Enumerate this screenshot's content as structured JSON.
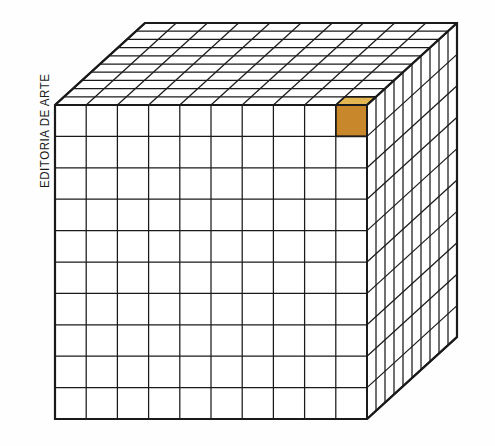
{
  "figure": {
    "credit": "EDITORIA DE ARTE",
    "background_color": "#fefefe",
    "line_color": "#1a1a1a",
    "face_fill_color": "#ffffff",
    "highlight": {
      "label": "cubinho destacado",
      "top_face_color": "#e4b652",
      "front_face_color": "#c8872a",
      "side_face_color": "#b87a22",
      "position_column": 10,
      "position_row": 1,
      "position_layer": 1
    },
    "geometry": {
      "divisions_width": 10,
      "divisions_height": 10,
      "divisions_depth": 10,
      "total_unit_cubes": 1000,
      "front_left_x": 55,
      "front_top_y": 105,
      "front_right_x": 367,
      "front_bottom_y": 419,
      "depth_dx": 90,
      "depth_dy": -82
    }
  }
}
